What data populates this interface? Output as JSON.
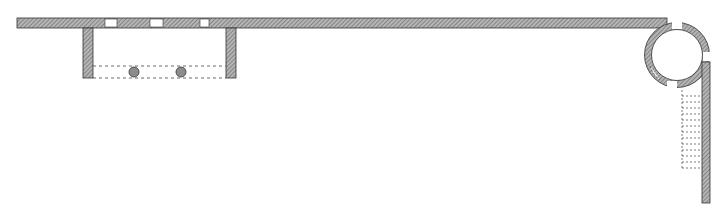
{
  "diagram": {
    "type": "architectural-floor-plan",
    "colors": {
      "wall_fill": "#9a9a9a",
      "wall_stroke": "#333333",
      "dashed_line": "#444444",
      "column_fill": "#8c8c8c",
      "background": "#ffffff"
    },
    "elements": {
      "top_wall": "long horizontal wall",
      "pavilion": "rectangular portico with two columns",
      "columns_count": 2,
      "window_openings_top": 3,
      "round_tower": "circular stair tower at right corner",
      "right_wall": "vertical wall descending from tower",
      "stair": "dashed steps alongside right wall"
    }
  }
}
